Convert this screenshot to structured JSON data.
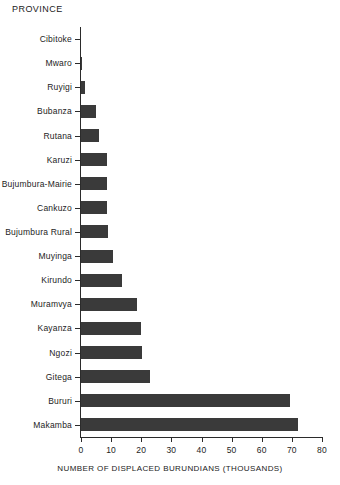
{
  "chart_data": {
    "type": "bar",
    "orientation": "horizontal",
    "title": "",
    "ylabel": "PROVINCE",
    "xlabel": "NUMBER OF DISPLACED BURUNDIANS (THOUSANDS)",
    "xlim": [
      0,
      80
    ],
    "xticks": [
      0,
      10,
      20,
      30,
      40,
      50,
      60,
      70,
      80
    ],
    "xtick_labels": [
      "0",
      "10",
      "20",
      "30",
      "40",
      "50",
      "60",
      "70",
      "80"
    ],
    "grid": false,
    "legend": false,
    "bar_color": "#3a3a3a",
    "axis_color": "#2b2b2b",
    "categories": [
      "Cibitoke",
      "Mwaro",
      "Ruyigi",
      "Bubanza",
      "Rutana",
      "Karuzi",
      "Bujumbura-Mairie",
      "Cankuzo",
      "Bujumbura Rural",
      "Muyinga",
      "Kirundo",
      "Muramvya",
      "Kayanza",
      "Ngozi",
      "Gitega",
      "Bururi",
      "Makamba"
    ],
    "values": [
      0.1,
      0.4,
      1.3,
      5.0,
      6.0,
      8.5,
      8.5,
      8.7,
      8.8,
      10.5,
      13.5,
      18.5,
      20.0,
      20.3,
      23.0,
      69.5,
      72.0
    ]
  }
}
